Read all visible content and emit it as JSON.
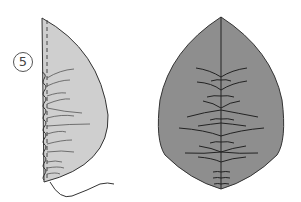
{
  "diagram": {
    "step_number": "5",
    "figures": [
      {
        "name": "half-leaf-gathered",
        "fill": "#cfcfcf",
        "description": "Half leaf shape with dashed seam line and zigzag gathered stitching on left edge, loose thread tail at bottom"
      },
      {
        "name": "full-leaf",
        "fill": "#8e8e8e",
        "description": "Full leaf shape with central vein and branching curved stitch lines"
      }
    ],
    "colors": {
      "outline": "#333333",
      "half_leaf_fill": "#cfcfcf",
      "full_leaf_fill": "#8e8e8e"
    }
  }
}
